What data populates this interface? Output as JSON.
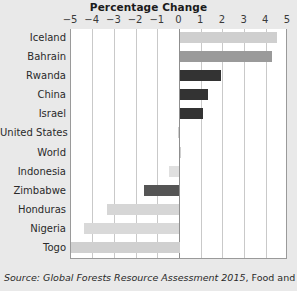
{
  "chart_data": {
    "type": "bar",
    "orientation": "horizontal",
    "title": "Percentage Change",
    "xlabel": "",
    "ylabel": "",
    "xlim": [
      -5,
      5
    ],
    "xticks": [
      -5,
      -4,
      -3,
      -2,
      -1,
      0,
      1,
      2,
      3,
      4,
      5
    ],
    "xticklabels": [
      "−5",
      "−4",
      "−3",
      "−2",
      "−1",
      "0",
      "1",
      "2",
      "3",
      "4",
      "5"
    ],
    "grid": true,
    "legend": false,
    "categories": [
      "Iceland",
      "Bahrain",
      "Rwanda",
      "China",
      "Israel",
      "United States",
      "World",
      "Indonesia",
      "Zimbabwe",
      "Honduras",
      "Nigeria",
      "Togo"
    ],
    "values": [
      4.5,
      4.25,
      1.9,
      1.3,
      1.1,
      -0.06,
      0.07,
      -0.5,
      -1.65,
      -3.35,
      -4.4,
      -5.0
    ],
    "bar_colors": [
      "#cfcfcf",
      "#9a9a9a",
      "#333333",
      "#333333",
      "#333333",
      "#cfcfcf",
      "#cfcfcf",
      "#e0e0e0",
      "#555555",
      "#d6d6d6",
      "#d9d9d9",
      "#d0d0d0"
    ],
    "source_prefix": "Source:",
    "source_italic": "Global Forests Resource Assessment 2015",
    "source_rest": ", Food and Agriculture"
  },
  "colors": {
    "figure_background": "#e9e9e9",
    "plot_background": "#ffffff",
    "gridline": "#c9c9c9",
    "zero_line": "#8f8f8f",
    "axis_border": "#9a9a9a",
    "title_text": "#1b1b1b",
    "label_text": "#2a2a2a"
  }
}
